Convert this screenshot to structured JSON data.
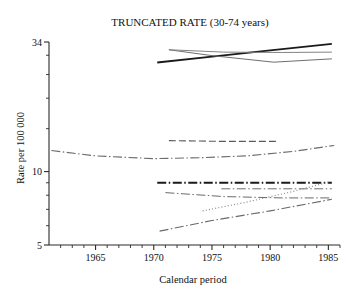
{
  "chart_data": {
    "type": "line",
    "title": "TRUNCATED RATE (30-74 years)",
    "xlabel": "Calendar period",
    "ylabel": "Rate per 100 000",
    "xlim": [
      1961,
      1986
    ],
    "ylim": [
      5,
      34
    ],
    "yscale": "log",
    "grid": false,
    "legend": "none",
    "xticks": [
      1965,
      1970,
      1975,
      1980,
      1985
    ],
    "xtick_labels": [
      "1965",
      "1970",
      "1975",
      "1980",
      "1985"
    ],
    "xminor_ticks": [
      1962,
      1963,
      1964,
      1966,
      1967,
      1968,
      1969,
      1971,
      1972,
      1973,
      1974,
      1976,
      1977,
      1978,
      1979,
      1981,
      1982,
      1983,
      1984,
      1986
    ],
    "yticks": [
      5,
      10,
      34
    ],
    "ytick_labels": [
      "5",
      "10",
      "34"
    ],
    "yminor_ticks": [
      6,
      7,
      8,
      9,
      15,
      20,
      25,
      30
    ],
    "series": [
      {
        "name": "upper-rising-solid-thick",
        "style": "solid",
        "width": 1.9,
        "color": "#1a1a1a",
        "x": [
          1970.3,
          1975.0,
          1980.0,
          1985.3
        ],
        "values": [
          28.0,
          29.6,
          31.4,
          33.4
        ]
      },
      {
        "name": "upper-declining-grey",
        "style": "solid",
        "width": 1.0,
        "color": "#6e6e6e",
        "x": [
          1971.3,
          1975.0,
          1980.3,
          1985.3
        ],
        "values": [
          31.6,
          29.9,
          28.1,
          29.0
        ]
      },
      {
        "name": "upper-flat-grey",
        "style": "solid",
        "width": 1.0,
        "color": "#828282",
        "x": [
          1971.3,
          1976.0,
          1981.0,
          1985.3
        ],
        "values": [
          31.6,
          30.9,
          30.8,
          30.9
        ]
      },
      {
        "name": "mid-dashed-flat",
        "style": "dashed",
        "width": 1.1,
        "color": "#5a5a5a",
        "x": [
          1971.3,
          1976.0,
          1980.5
        ],
        "values": [
          13.4,
          13.3,
          13.3
        ]
      },
      {
        "name": "mid-long-dashdot-curve",
        "style": "dashdot",
        "width": 1.1,
        "color": "#6b6b6b",
        "x": [
          1961.2,
          1965.0,
          1970.0,
          1974.0,
          1978.0,
          1982.0,
          1985.5
        ],
        "values": [
          12.2,
          11.6,
          11.3,
          11.4,
          11.6,
          12.1,
          12.8
        ]
      },
      {
        "name": "low-thick-dashdot-flat",
        "style": "dashdot",
        "width": 1.9,
        "color": "#1a1a1a",
        "x": [
          1970.3,
          1976.0,
          1981.0,
          1985.3
        ],
        "values": [
          9.0,
          9.0,
          9.0,
          9.0
        ]
      },
      {
        "name": "low-dashdot-flat-grey",
        "style": "dashdot",
        "width": 1.0,
        "color": "#707070",
        "x": [
          1975.8,
          1980.0,
          1985.3
        ],
        "values": [
          8.5,
          8.5,
          8.5
        ]
      },
      {
        "name": "low-declining-dashdot",
        "style": "dashdot",
        "width": 1.0,
        "color": "#6a6a6a",
        "x": [
          1971.0,
          1976.0,
          1981.0,
          1985.3
        ],
        "values": [
          8.2,
          7.9,
          7.8,
          7.8
        ]
      },
      {
        "name": "low-dotted-rising",
        "style": "dotted",
        "width": 1.2,
        "color": "#8a8a8a",
        "x": [
          1974.2,
          1978.0,
          1982.0,
          1985.2
        ],
        "values": [
          6.9,
          7.5,
          8.3,
          9.1
        ]
      },
      {
        "name": "low-dashdot-steep-rising",
        "style": "dashdot",
        "width": 1.1,
        "color": "#6a6a6a",
        "x": [
          1970.5,
          1975.0,
          1980.0,
          1985.3
        ],
        "values": [
          5.7,
          6.3,
          6.9,
          7.7
        ]
      }
    ]
  }
}
